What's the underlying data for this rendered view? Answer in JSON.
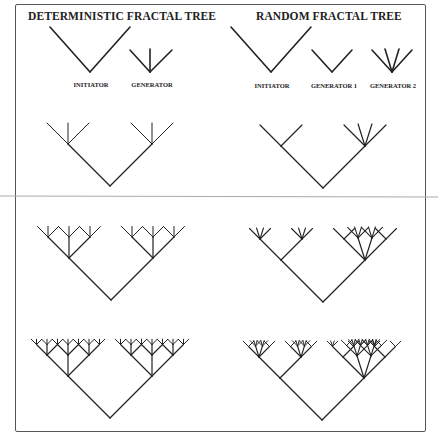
{
  "titles": {
    "left": "DETERMINISTIC FRACTAL TREE",
    "right": "RANDOM FRACTAL TREE"
  },
  "labels": {
    "det_initiator": "INITIATOR",
    "det_generator": "GENERATOR",
    "rand_initiator": "INITIATOR",
    "rand_generator1": "GENERATOR 1",
    "rand_generator2": "GENERATOR 2"
  },
  "colors": {
    "stroke": "#222222",
    "frame": "#555555",
    "divider": "#aaaaaa"
  },
  "panels": {
    "deterministic": {
      "generator": "three-branch (left 45°, vertical, right 45°)",
      "stages": [
        {
          "apex": [
            110,
            186
          ],
          "size": 42,
          "depth": 1
        },
        {
          "apex": [
            111,
            300
          ],
          "size": 42,
          "depth": 2
        },
        {
          "apex": [
            110,
            418
          ],
          "size": 42,
          "depth": 3
        }
      ]
    },
    "random": {
      "generator_1": "two-branch",
      "generator_2": "four-branch fan",
      "stages": [
        {
          "apex": [
            323,
            188
          ],
          "size": 42,
          "pattern": [
            0,
            1
          ]
        },
        {
          "apex": [
            323,
            302
          ],
          "size": 42,
          "pattern": [
            [
              0,
              [
                1,
                1
              ]
            ],
            [
              1,
              [
                1,
                0,
                1,
                0
              ]
            ]
          ]
        },
        {
          "apex": [
            322,
            420
          ],
          "size": 42,
          "pattern": [
            [
              0,
              [
                [
                  1,
                  [
                    1,
                    1,
                    1,
                    1
                  ]
                ],
                [
                  1,
                  [
                    1,
                    1,
                    1,
                    1
                  ]
                ]
              ]
            ],
            [
              1,
              [
                [
                  1,
                  [
                    1,
                    0,
                    1,
                    1
                  ]
                ],
                [
                  0,
                  [
                    1,
                    1
                  ]
                ],
                [
                  1,
                  [
                    1,
                    1,
                    0,
                    1
                  ]
                ],
                [
                  0,
                  [
                    1,
                    1
                  ]
                ]
              ]
            ]
          ]
        }
      ]
    }
  }
}
